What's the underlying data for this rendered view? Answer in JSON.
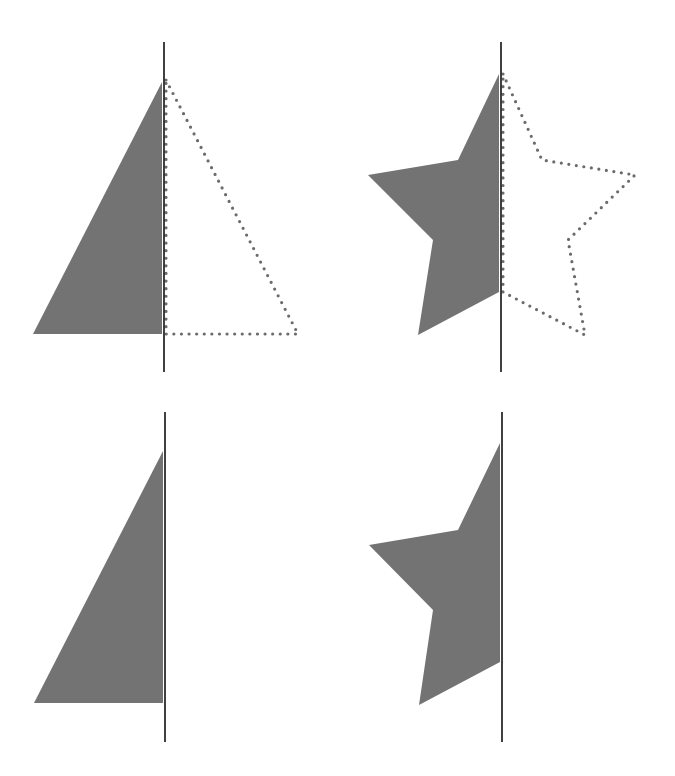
{
  "colors": {
    "background": "#ffffff",
    "fill": "#737373",
    "axis": "#111111",
    "dots": "#6b6b6b"
  },
  "panels": [
    {
      "id": "top-left",
      "description": "Half triangle with dotted mirror image across line of symmetry",
      "axis": {
        "x": 164,
        "y1": 42,
        "y2": 372
      },
      "filled_points": "33,334 162,82 162,334",
      "dotted_points": "166,80 298,334 166,334",
      "show_dotted": true
    },
    {
      "id": "top-right",
      "description": "Half star with dotted mirror image across line of symmetry",
      "axis": {
        "x": 501,
        "y1": 42,
        "y2": 372
      },
      "filled_points": "499,74 458,160 368,175 433,240 418,335 499,292",
      "dotted_points": "503,74 542,160 635,175 568,240 585,335 503,292",
      "show_dotted": true
    },
    {
      "id": "bottom-left",
      "description": "Half triangle beside line of symmetry (no mirror)",
      "axis": {
        "x": 165,
        "y1": 412,
        "y2": 742
      },
      "filled_points": "34,703 163,451 163,703",
      "dotted_points": "",
      "show_dotted": false
    },
    {
      "id": "bottom-right",
      "description": "Half star beside line of symmetry (no mirror)",
      "axis": {
        "x": 502,
        "y1": 412,
        "y2": 742
      },
      "filled_points": "500,443 458,530 369,545 433,610 419,705 500,662",
      "dotted_points": "",
      "show_dotted": false
    }
  ]
}
